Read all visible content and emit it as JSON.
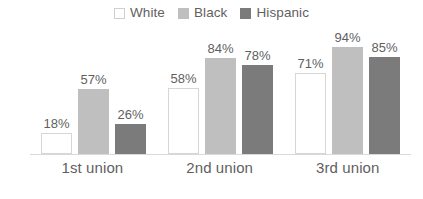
{
  "chart_data": {
    "type": "bar",
    "title": "",
    "subtitle": "",
    "xlabel": "",
    "ylabel": "",
    "ylim": [
      0,
      100
    ],
    "grid": false,
    "legend_position": "top-center",
    "value_suffix": "%",
    "categories": [
      "1st union",
      "2nd union",
      "3rd union"
    ],
    "series": [
      {
        "name": "White",
        "color": "#ffffff",
        "border_color": "#d6d6d6",
        "values": [
          18,
          57,
          26
        ],
        "labels": [
          "18%",
          "",
          ""
        ]
      },
      {
        "name": "Black",
        "color": "#bfbfbf",
        "border_color": "#bfbfbf",
        "values": [
          57,
          84,
          94
        ],
        "labels": [
          "",
          "",
          ""
        ]
      },
      {
        "name": "Hispanic",
        "color": "#7b7b7b",
        "border_color": "#7b7b7b",
        "values": [
          26,
          78,
          85
        ],
        "labels": [
          "",
          "",
          ""
        ]
      }
    ],
    "groups": [
      {
        "category": "1st union",
        "bars": [
          {
            "series": "White",
            "value": 18,
            "label": "18%"
          },
          {
            "series": "Black",
            "value": 57,
            "label": "57%"
          },
          {
            "series": "Hispanic",
            "value": 26,
            "label": "26%"
          }
        ]
      },
      {
        "category": "2nd union",
        "bars": [
          {
            "series": "White",
            "value": 58,
            "label": "58%"
          },
          {
            "series": "Black",
            "value": 84,
            "label": "84%"
          },
          {
            "series": "Hispanic",
            "value": 78,
            "label": "78%"
          }
        ]
      },
      {
        "category": "3rd union",
        "bars": [
          {
            "series": "White",
            "value": 71,
            "label": "71%"
          },
          {
            "series": "Black",
            "value": 94,
            "label": "94%"
          },
          {
            "series": "Hispanic",
            "value": 85,
            "label": "85%"
          }
        ]
      }
    ]
  },
  "legend": {
    "entries": [
      {
        "label": "White",
        "color": "#ffffff",
        "border_color": "#cfcfcf"
      },
      {
        "label": "Black",
        "color": "#bfbfbf",
        "border_color": "#bfbfbf"
      },
      {
        "label": "Hispanic",
        "color": "#7b7b7b",
        "border_color": "#7b7b7b"
      }
    ]
  },
  "axis": {
    "baseline_color": "#d9d9d9",
    "text_color": "#5f5f5f"
  }
}
